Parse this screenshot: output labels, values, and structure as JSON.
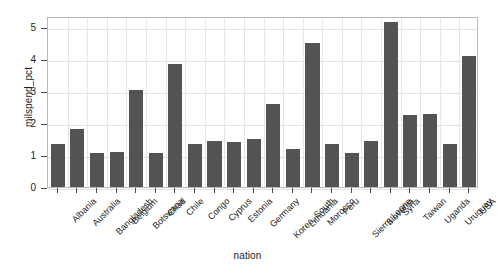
{
  "chart_data": {
    "type": "bar",
    "title": "",
    "xlabel": "nation",
    "ylabel": "milspend_pct",
    "categories": [
      "Albania",
      "Australia",
      "Bangladesh",
      "Belgium",
      "Botswana",
      "Chad",
      "Chile",
      "Congo",
      "Cyprus",
      "Estonia",
      "Germany",
      "Korea, South",
      "Lithuania",
      "Morocco",
      "Peru",
      "Sierra Leone",
      "Slovenia",
      "Syria",
      "Taiwan",
      "Uganda",
      "Uruguay",
      "USA"
    ],
    "values": [
      1.35,
      1.8,
      1.05,
      1.1,
      3.05,
      1.05,
      3.85,
      1.35,
      1.45,
      1.4,
      1.5,
      2.6,
      1.2,
      4.5,
      1.35,
      1.05,
      1.45,
      5.15,
      2.25,
      2.3,
      1.35,
      4.1
    ],
    "ylim": [
      0,
      5.35
    ],
    "xlim": [
      0,
      22
    ],
    "y_ticks": [
      0,
      1,
      2,
      3,
      4,
      5
    ],
    "y_tick_labels": [
      "0",
      "1",
      "2",
      "3",
      "4",
      "5"
    ],
    "grid": true,
    "legend": false,
    "legend_position": "none",
    "bar_color": "#535353",
    "grid_color": "#e2e2e2",
    "frame_color": "#b9b9b9",
    "background_color": "#ffffff",
    "text_color": "#1c1c1c"
  }
}
